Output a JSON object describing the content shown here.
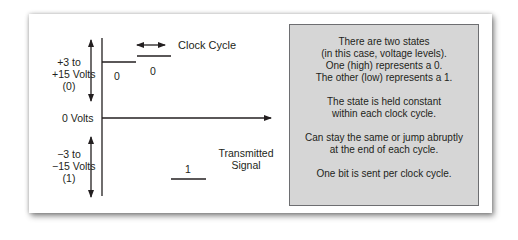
{
  "diagram": {
    "axis_labels": {
      "high": [
        "+3 to",
        "+15 Volts",
        "(0)"
      ],
      "zero": "0 Volts",
      "low": [
        "−3 to",
        "−15 Volts",
        "(1)"
      ]
    },
    "clock_cycle_label": "Clock Cycle",
    "signal_label": [
      "Transmitted",
      "Signal"
    ],
    "bits": [
      {
        "value": "0",
        "level": "high"
      },
      {
        "value": "0",
        "level": "high"
      },
      {
        "value": "1",
        "level": "low"
      }
    ],
    "info_box": {
      "paragraphs": [
        [
          "There are two states",
          "(in this case, voltage levels).",
          "One (high) represents a 0.",
          "The other (low) represents a 1."
        ],
        [
          "The state is held constant",
          "within each clock cycle."
        ],
        [
          "Can stay the same or jump abruptly",
          "at the end of each cycle."
        ],
        [
          "One bit is sent per clock cycle."
        ]
      ]
    },
    "colors": {
      "ink": "#231f20",
      "info_box_fill": "#d6d6d6",
      "info_box_border": "#6d6e71"
    }
  }
}
